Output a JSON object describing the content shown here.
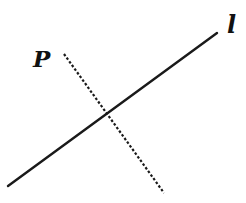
{
  "diagram": {
    "labels": {
      "point": "P",
      "line": "l"
    },
    "line_l": {
      "x1": 8,
      "y1": 186,
      "x2": 217,
      "y2": 33,
      "style": "solid"
    },
    "perpendicular": {
      "x1": 64,
      "y1": 54,
      "x2": 164,
      "y2": 193,
      "style": "dashed"
    },
    "colors": {
      "stroke": "#1a1a1a",
      "background": "#ffffff"
    }
  }
}
